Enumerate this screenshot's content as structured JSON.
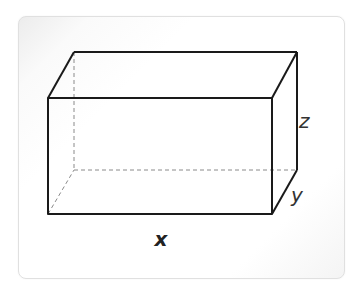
{
  "diagram": {
    "type": "rectangular-prism",
    "labels": {
      "x": "x",
      "y": "y",
      "z": "z"
    },
    "colors": {
      "edge": "#1a1a1a",
      "hidden_edge": "#8a8a8a",
      "label": "#333333",
      "background": "#ffffff"
    }
  }
}
